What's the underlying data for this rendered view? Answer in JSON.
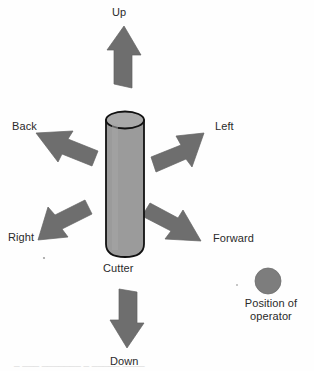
{
  "figure": {
    "type": "diagram",
    "background_color": "#fefefe"
  },
  "colors": {
    "arrow_fill": "#6e6e6e",
    "arrow_stroke": "#5a5a5a",
    "cylinder_body": "#9b9b9b",
    "cylinder_top": "#a8a8a8",
    "cylinder_outline": "#1a1a1a",
    "operator_dot": "#7d7d7d",
    "text": "#2a2a2a"
  },
  "center_object": {
    "name": "cutter",
    "label": "Cutter",
    "shape": "cylinder"
  },
  "operator": {
    "marker": "operator-dot",
    "label_line1": "Position of",
    "label_line2": "operator"
  },
  "arrows": [
    {
      "id": "up",
      "label": "Up",
      "direction": "up",
      "angle_deg": 90
    },
    {
      "id": "down",
      "label": "Down",
      "direction": "down",
      "angle_deg": 270
    },
    {
      "id": "back",
      "label": "Back",
      "direction": "up-left",
      "angle_deg": 155
    },
    {
      "id": "left",
      "label": "Left",
      "direction": "up-right",
      "angle_deg": 25
    },
    {
      "id": "right",
      "label": "Right",
      "direction": "down-left",
      "angle_deg": 205
    },
    {
      "id": "forward",
      "label": "Forward",
      "direction": "down-right",
      "angle_deg": 335
    }
  ],
  "caption": {
    "text": "clipped-figure-caption"
  }
}
